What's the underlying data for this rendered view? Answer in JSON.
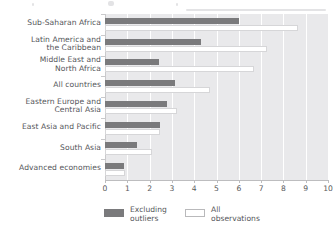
{
  "chart_data": {
    "type": "bar",
    "orientation": "horizontal",
    "title": "",
    "subtitle": "",
    "xlabel": "",
    "ylabel": "",
    "xlim": [
      0,
      10
    ],
    "xticks": [
      "0",
      "1",
      "2",
      "3",
      "4",
      "5",
      "6",
      "7",
      "8",
      "9",
      "10"
    ],
    "grid": true,
    "grid_axis": "x",
    "legend_position": "bottom",
    "categories": [
      "Sub-Saharan Africa",
      "Latin America and\nthe Caribbean",
      "Middle East and\nNorth Africa",
      "All countries",
      "Eastern Europe and\nCentral Asia",
      "East Asia and Pacific",
      "South Asia",
      "Advanced economies"
    ],
    "series": [
      {
        "name": "Excluding outliers",
        "color": "#7a7a7c",
        "values": [
          6.0,
          4.3,
          2.4,
          3.15,
          2.8,
          2.45,
          1.45,
          0.85
        ]
      },
      {
        "name": "All observations",
        "color": "#ffffff",
        "values": [
          8.65,
          7.25,
          6.7,
          4.7,
          3.25,
          2.45,
          2.1,
          0.9
        ]
      }
    ]
  },
  "legend": {
    "items": [
      {
        "label": "Excluding\noutliers",
        "swatch": "dark"
      },
      {
        "label": "All\nobservations",
        "swatch": "light"
      }
    ]
  },
  "axis": {
    "tick_labels": [
      "0",
      "1",
      "2",
      "3",
      "4",
      "5",
      "6",
      "7",
      "8",
      "9",
      "10"
    ]
  },
  "colors": {
    "bar_dark": "#7a7a7c",
    "bar_light": "#ffffff",
    "plot_background": "#e9e9eb",
    "gridline": "#ffffff",
    "text": "#55565a"
  }
}
